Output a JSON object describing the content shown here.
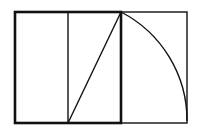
{
  "diagram": {
    "colors": {
      "stroke": "#111111",
      "background": "#ffffff"
    },
    "square": {
      "x": 15,
      "y": 12,
      "size": 107
    },
    "midline_x": 68,
    "diagonal": {
      "from": [
        68,
        123
      ],
      "to": [
        121,
        12
      ]
    },
    "arc": {
      "center": [
        68,
        123
      ],
      "from": [
        121,
        12
      ],
      "to": [
        187,
        123
      ]
    },
    "extension": {
      "x": 121,
      "y": 12,
      "width": 66,
      "height": 111
    }
  }
}
